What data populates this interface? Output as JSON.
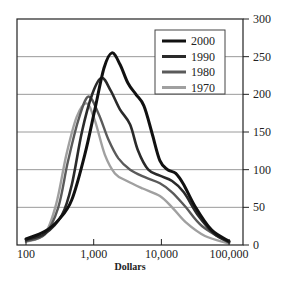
{
  "chart_data": {
    "type": "line",
    "title": "",
    "xlabel": "Dollars",
    "ylabel": "",
    "x_scale": "log",
    "xlim": [
      100,
      100000
    ],
    "ylim": [
      0,
      300
    ],
    "grid": {
      "horizontal": true,
      "vertical": false
    },
    "legend_position": "upper right",
    "x_ticks": [
      {
        "value": 100,
        "label": "100"
      },
      {
        "value": 1000,
        "label": "1,000"
      },
      {
        "value": 10000,
        "label": "10,000"
      },
      {
        "value": 100000,
        "label": "100,000"
      }
    ],
    "y_ticks": [
      {
        "value": 0,
        "label": "0"
      },
      {
        "value": 50,
        "label": "50"
      },
      {
        "value": 100,
        "label": "100"
      },
      {
        "value": 150,
        "label": "150"
      },
      {
        "value": 200,
        "label": "200"
      },
      {
        "value": 250,
        "label": "250"
      },
      {
        "value": 300,
        "label": "300"
      }
    ],
    "series": [
      {
        "name": "2000",
        "color": "#111111",
        "width": 3,
        "x": [
          100,
          190,
          315,
          475,
          740,
          1040,
          1420,
          1860,
          2440,
          3200,
          4200,
          5500,
          7200,
          9500,
          12400,
          16300,
          21400,
          32000,
          55000,
          100000
        ],
        "values": [
          8,
          18,
          35,
          60,
          120,
          180,
          235,
          255,
          240,
          215,
          200,
          185,
          150,
          112,
          100,
          95,
          80,
          50,
          20,
          5
        ]
      },
      {
        "name": "1990",
        "color": "#2a2a2a",
        "width": 2.6,
        "x": [
          100,
          190,
          340,
          475,
          670,
          950,
          1310,
          1780,
          2440,
          3450,
          4520,
          6400,
          9500,
          14400,
          21400,
          34500,
          60000,
          100000
        ],
        "values": [
          7,
          15,
          40,
          80,
          150,
          200,
          222,
          205,
          180,
          160,
          125,
          100,
          92,
          85,
          70,
          40,
          15,
          4
        ]
      },
      {
        "name": "1980",
        "color": "#5a5a5a",
        "width": 2.4,
        "x": [
          100,
          190,
          300,
          415,
          590,
          830,
          1170,
          1650,
          2320,
          3450,
          5700,
          9500,
          14400,
          23000,
          40000,
          100000
        ],
        "values": [
          5,
          14,
          50,
          110,
          165,
          197,
          175,
          140,
          115,
          100,
          90,
          82,
          70,
          50,
          25,
          3
        ]
      },
      {
        "name": "1970",
        "color": "#a0a0a0",
        "width": 2.4,
        "x": [
          100,
          190,
          280,
          395,
          560,
          790,
          1040,
          1460,
          2060,
          3100,
          5300,
          9500,
          14400,
          23000,
          44000,
          100000
        ],
        "values": [
          4,
          15,
          55,
          120,
          170,
          188,
          165,
          120,
          95,
          85,
          75,
          65,
          50,
          30,
          12,
          2
        ]
      }
    ]
  },
  "legend": {
    "items": [
      {
        "label": "2000",
        "color": "#111111"
      },
      {
        "label": "1990",
        "color": "#2a2a2a"
      },
      {
        "label": "1980",
        "color": "#5a5a5a"
      },
      {
        "label": "1970",
        "color": "#a0a0a0"
      }
    ]
  },
  "axes": {
    "x_title": "Dollars",
    "x_labels": [
      "100",
      "1,000",
      "10,000",
      "100,000"
    ],
    "y_labels": [
      "0",
      "50",
      "100",
      "150",
      "200",
      "250",
      "300"
    ]
  }
}
